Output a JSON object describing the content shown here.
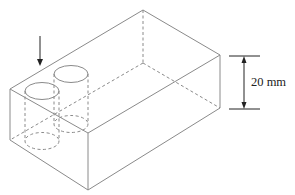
{
  "figure": {
    "type": "isometric-block-with-cylindrical-holes",
    "dimension": {
      "label": "20 mm",
      "refers_to": "block height"
    },
    "load_arrow": {
      "direction": "down",
      "position": "above left hole"
    },
    "holes": 2,
    "colors": {
      "edge": "#8a8a8a",
      "dimension": "#222222",
      "background": "#ffffff"
    }
  }
}
